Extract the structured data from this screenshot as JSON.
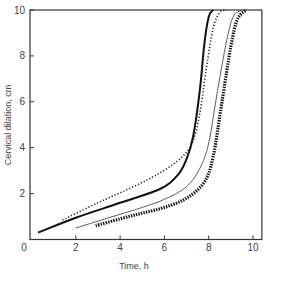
{
  "chart_data": {
    "type": "line",
    "title": "",
    "xlabel": "Time, h",
    "ylabel": "Cervical dilation, cm",
    "xlim": [
      0,
      10.4
    ],
    "ylim": [
      0,
      10
    ],
    "xticks": [
      0,
      2,
      4,
      6,
      8,
      10
    ],
    "yticks": [
      2,
      4,
      6,
      8,
      10
    ],
    "ytick_zero_label": "0",
    "grid": false,
    "legend": null,
    "series": [
      {
        "name": "thick-solid",
        "style": "solid-heavy",
        "x": [
          0.3,
          2.0,
          4.0,
          5.8,
          6.6,
          7.0,
          7.3,
          7.6,
          7.8,
          8.0,
          8.2
        ],
        "y": [
          0.3,
          0.95,
          1.6,
          2.2,
          2.8,
          3.5,
          4.5,
          6.5,
          8.5,
          9.7,
          10.0
        ]
      },
      {
        "name": "fine-dotted",
        "style": "dotted-fine",
        "x": [
          1.4,
          3.0,
          4.6,
          5.8,
          6.8,
          7.3,
          7.6,
          7.9,
          8.2,
          8.5,
          8.8
        ],
        "y": [
          0.85,
          1.6,
          2.3,
          2.9,
          3.6,
          4.3,
          5.5,
          7.5,
          9.2,
          9.9,
          10.0
        ]
      },
      {
        "name": "thin-solid",
        "style": "solid-thin",
        "x": [
          2.0,
          3.5,
          5.0,
          6.0,
          7.0,
          7.6,
          8.0,
          8.4,
          8.8,
          9.1,
          9.5
        ],
        "y": [
          0.5,
          0.95,
          1.4,
          1.75,
          2.3,
          3.1,
          4.2,
          6.5,
          8.6,
          9.7,
          10.0
        ]
      },
      {
        "name": "heavy-dotted",
        "style": "dotted-heavy",
        "x": [
          2.9,
          4.0,
          5.0,
          6.0,
          7.0,
          7.8,
          8.2,
          8.6,
          9.0,
          9.3,
          9.7
        ],
        "y": [
          0.6,
          0.9,
          1.15,
          1.4,
          1.8,
          2.5,
          3.6,
          6.0,
          8.4,
          9.6,
          10.0
        ]
      }
    ]
  }
}
